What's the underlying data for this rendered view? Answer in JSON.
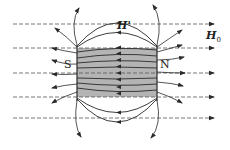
{
  "diagram": {
    "labels": {
      "south": "S",
      "north": "N",
      "h_prime": "H'",
      "h0_main": "H",
      "h0_sub": "0"
    },
    "colors": {
      "magnet_fill": "#b4b4b4",
      "line": "#2a2a2a",
      "dashed": "#555555",
      "background": "#ffffff"
    },
    "external_field_lines_y": [
      24,
      48,
      73,
      97,
      118
    ],
    "magnet": {
      "x": 77,
      "y": 48,
      "width": 80,
      "height": 49
    }
  }
}
